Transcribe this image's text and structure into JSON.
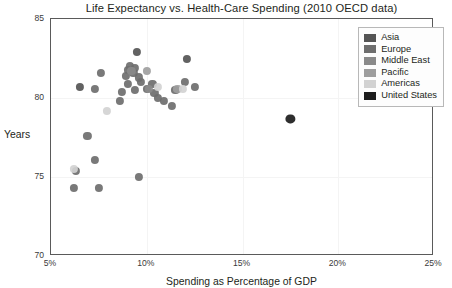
{
  "chart_data": {
    "type": "scatter",
    "title": "Life Expectancy vs. Health-Care Spending (2010 OECD data)",
    "xlabel": "Spending as Percentage of GDP",
    "ylabel": "Years",
    "xlim": [
      5,
      25
    ],
    "ylim": [
      70,
      85
    ],
    "xticks": [
      "5%",
      "10%",
      "15%",
      "20%",
      "25%"
    ],
    "xtick_values": [
      5,
      10,
      15,
      20,
      25
    ],
    "yticks": [
      "70",
      "75",
      "80",
      "85"
    ],
    "ytick_values": [
      70,
      75,
      80,
      85
    ],
    "grid": true,
    "legend_position": "top-right",
    "colors": {
      "asia": "#555555",
      "europe": "#6e6e6e",
      "middle_east": "#8a8a8a",
      "pacific": "#9e9e9e",
      "americas": "#d2d2d2",
      "united_states": "#1c1c1c"
    },
    "series": [
      {
        "name": "Asia",
        "color": "#555555",
        "points": [
          {
            "x": 6.5,
            "y": 80.7
          },
          {
            "x": 9.5,
            "y": 82.9
          },
          {
            "x": 12.1,
            "y": 82.5
          }
        ]
      },
      {
        "name": "Europe",
        "color": "#6e6e6e",
        "points": [
          {
            "x": 8.9,
            "y": 81.4
          },
          {
            "x": 9.0,
            "y": 81.8
          },
          {
            "x": 9.1,
            "y": 82.0
          },
          {
            "x": 9.3,
            "y": 81.6
          },
          {
            "x": 9.4,
            "y": 81.9
          },
          {
            "x": 9.6,
            "y": 81.3
          },
          {
            "x": 9.7,
            "y": 81.0
          },
          {
            "x": 9.0,
            "y": 80.9
          },
          {
            "x": 8.7,
            "y": 80.4
          },
          {
            "x": 8.6,
            "y": 79.8
          },
          {
            "x": 9.4,
            "y": 80.5
          },
          {
            "x": 10.0,
            "y": 80.6
          },
          {
            "x": 10.3,
            "y": 80.9
          },
          {
            "x": 10.4,
            "y": 80.3
          },
          {
            "x": 10.6,
            "y": 80.0
          },
          {
            "x": 10.9,
            "y": 79.8
          },
          {
            "x": 11.3,
            "y": 79.5
          },
          {
            "x": 11.5,
            "y": 80.5
          },
          {
            "x": 12.0,
            "y": 81.0
          },
          {
            "x": 12.5,
            "y": 80.7
          },
          {
            "x": 7.6,
            "y": 81.6
          },
          {
            "x": 7.3,
            "y": 80.6
          },
          {
            "x": 6.9,
            "y": 77.6
          },
          {
            "x": 7.3,
            "y": 76.1
          },
          {
            "x": 6.3,
            "y": 75.4
          },
          {
            "x": 6.2,
            "y": 74.3
          },
          {
            "x": 7.5,
            "y": 74.3
          },
          {
            "x": 9.6,
            "y": 75.0
          }
        ]
      },
      {
        "name": "Middle East",
        "color": "#8a8a8a",
        "points": [
          {
            "x": 9.2,
            "y": 81.7
          },
          {
            "x": 10.1,
            "y": 80.6
          }
        ]
      },
      {
        "name": "Pacific",
        "color": "#9e9e9e",
        "points": [
          {
            "x": 10.0,
            "y": 81.7
          },
          {
            "x": 11.6,
            "y": 80.6
          }
        ]
      },
      {
        "name": "Americas",
        "color": "#d2d2d2",
        "points": [
          {
            "x": 7.9,
            "y": 79.2
          },
          {
            "x": 11.9,
            "y": 80.6
          },
          {
            "x": 10.6,
            "y": 80.7
          },
          {
            "x": 6.2,
            "y": 75.5
          }
        ]
      },
      {
        "name": "United States",
        "color": "#1c1c1c",
        "points": [
          {
            "x": 17.5,
            "y": 78.7
          }
        ]
      }
    ]
  },
  "legend": {
    "items": [
      {
        "label": "Asia",
        "color": "#555555"
      },
      {
        "label": "Europe",
        "color": "#6e6e6e"
      },
      {
        "label": "Middle East",
        "color": "#8a8a8a"
      },
      {
        "label": "Pacific",
        "color": "#9e9e9e"
      },
      {
        "label": "Americas",
        "color": "#d2d2d2"
      },
      {
        "label": "United States",
        "color": "#1c1c1c"
      }
    ]
  }
}
